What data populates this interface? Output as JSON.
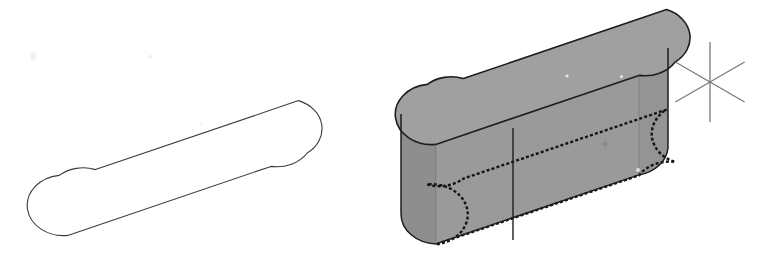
{
  "figure": {
    "kind": "cad-viewport-screenshot",
    "application": "AutoCAD",
    "background_color": "#ffffff",
    "width": 780,
    "height": 261,
    "caption": ""
  },
  "colors": {
    "outline_stroke": "#3a3a3a",
    "solid_outline_stroke": "#1d1d1d",
    "hidden_line_stroke": "#141414",
    "top_face_fill": "#a0a0a0",
    "front_left_face_fill": "#9a9a9a",
    "front_right_face_fill": "#949494",
    "end_cap_fill": "#8e8e8e",
    "crosshair_stroke": "#7a7a7a",
    "marker_stroke": "#8a8a8a",
    "background": "#ffffff"
  },
  "views": {
    "left": {
      "name": "2D profile view",
      "label": "",
      "shape": "stadium",
      "geometry": {
        "left_cap_center_x": 69,
        "left_cap_center_y": 205,
        "right_cap_center_x": 272,
        "right_cap_center_y": 136,
        "cap_radius_x": 36,
        "cap_radius_y": 30,
        "stroke_width": 1.1
      }
    },
    "right": {
      "name": "3D extruded solid view",
      "label": "",
      "shape": "extruded-stadium-solid",
      "geometry": {
        "top_left_cap_center_x": 437,
        "top_left_cap_center_y": 114,
        "top_right_cap_center_x": 632,
        "top_right_cap_center_y": 48,
        "cap_radius_x": 36,
        "cap_radius_y": 30,
        "extrusion_height": 100,
        "tangent_line_x_left": 401,
        "tangent_line_x_right": 668,
        "tangent_line_x_mid": 513,
        "stroke_width": 1.6,
        "hidden_dash_pattern": "3 2.2"
      }
    }
  },
  "cursor": {
    "name": "isometric crosshair",
    "center_x": 710,
    "center_y": 82,
    "vertical_arm_length": 40,
    "iso_arm_length": 40,
    "iso_angle_degrees": 30,
    "stroke_width": 1.3
  },
  "markers": [
    {
      "name": "ucs-blip-marker",
      "x": 605,
      "y": 144,
      "size": 7
    },
    {
      "name": "pick-blip-marker",
      "x": 567,
      "y": 76,
      "size": 3
    }
  ],
  "scan_artifacts": [
    {
      "x": 30,
      "y": 52,
      "w": 6,
      "h": 9
    },
    {
      "x": 148,
      "y": 55,
      "w": 5,
      "h": 4
    },
    {
      "x": 200,
      "y": 122,
      "w": 3,
      "h": 3
    },
    {
      "x": 636,
      "y": 168,
      "w": 4,
      "h": 4
    },
    {
      "x": 620,
      "y": 75,
      "w": 3,
      "h": 3
    }
  ]
}
